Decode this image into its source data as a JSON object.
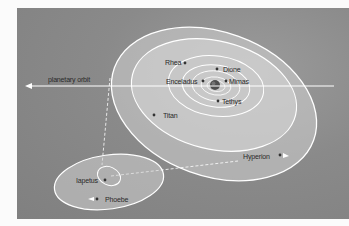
{
  "diagram": {
    "colors": {
      "background": "#888888",
      "orbit_line": "#ffffff",
      "orbit_fill": "#cfcfcf",
      "planet": "#555555",
      "label": "#2a2a2a"
    },
    "reference_line": {
      "label": "planetary orbit"
    },
    "inner_system": {
      "moons": [
        {
          "name": "Rhea",
          "x": 165,
          "y": 62
        },
        {
          "name": "Dione",
          "x": 223,
          "y": 69
        },
        {
          "name": "Enceladus",
          "x": 166,
          "y": 81
        },
        {
          "name": "Mimas",
          "x": 228,
          "y": 81
        },
        {
          "name": "Tethys",
          "x": 224,
          "y": 101
        },
        {
          "name": "Titan",
          "x": 163,
          "y": 115
        },
        {
          "name": "Hyperion",
          "x": 243,
          "y": 156
        }
      ]
    },
    "outer_system": {
      "moons": [
        {
          "name": "Iapetus",
          "x": 76,
          "y": 180
        },
        {
          "name": "Phoebe",
          "x": 105,
          "y": 199
        }
      ]
    }
  }
}
